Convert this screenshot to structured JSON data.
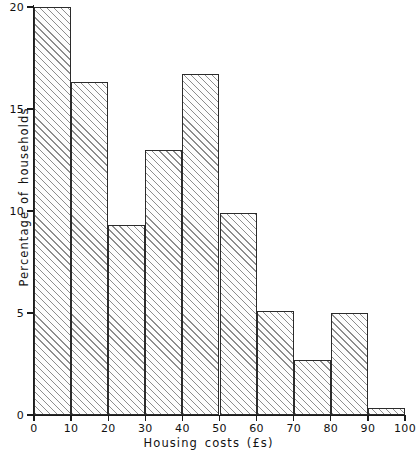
{
  "chart_data": {
    "type": "bar",
    "title": "",
    "subtitle": "",
    "xlabel": "Housing costs (£s)",
    "ylabel": "Percentage of households",
    "xlim": [
      0,
      100
    ],
    "ylim": [
      0,
      20
    ],
    "grid": false,
    "legend": null,
    "bin_width": 10,
    "bin_edges": [
      0,
      10,
      20,
      30,
      40,
      50,
      60,
      70,
      80,
      90,
      100
    ],
    "categories": [
      "0–10",
      "10–20",
      "20–30",
      "30–40",
      "40–50",
      "50–60",
      "60–70",
      "70–80",
      "80–90",
      "90–100"
    ],
    "values": [
      20.0,
      16.3,
      9.3,
      13.0,
      16.7,
      9.9,
      5.1,
      2.7,
      5.0,
      0.35
    ],
    "xticks": [
      {
        "value": 0,
        "label": "0"
      },
      {
        "value": 10,
        "label": "10"
      },
      {
        "value": 20,
        "label": "20"
      },
      {
        "value": 30,
        "label": "30"
      },
      {
        "value": 40,
        "label": "40"
      },
      {
        "value": 50,
        "label": "50"
      },
      {
        "value": 60,
        "label": "60"
      },
      {
        "value": 70,
        "label": "70"
      },
      {
        "value": 80,
        "label": "80"
      },
      {
        "value": 90,
        "label": "90"
      },
      {
        "value": 100,
        "label": "100"
      }
    ],
    "yticks": [
      {
        "value": 0,
        "label": "0"
      },
      {
        "value": 5,
        "label": "5"
      },
      {
        "value": 10,
        "label": "10"
      },
      {
        "value": 15,
        "label": "15"
      },
      {
        "value": 20,
        "label": "20"
      }
    ],
    "style": {
      "bar_fill": "#fdfdfd",
      "bar_hatch": "diagonal-45",
      "bar_hatch_color": "#8d8d8d",
      "bar_edge_color": "#2b2b2b",
      "axis_color": "#1a1a1a",
      "background": "#ffffff"
    }
  }
}
